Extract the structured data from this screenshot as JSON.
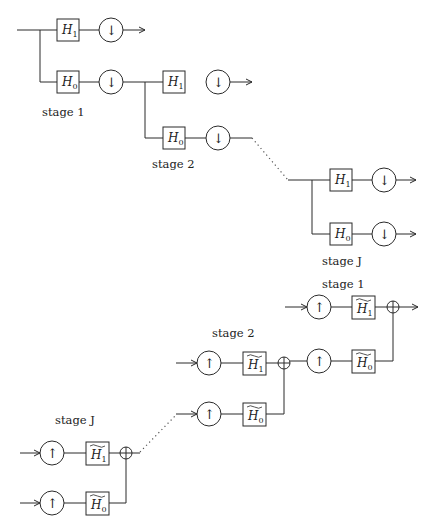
{
  "diagram": {
    "analysis": {
      "stages": [
        {
          "label": "stage 1",
          "highpass": {
            "name": "H",
            "sub": "1"
          },
          "lowpass": {
            "name": "H",
            "sub": "0"
          },
          "downsample_symbol": "↓"
        },
        {
          "label": "stage 2",
          "highpass": {
            "name": "H",
            "sub": "1"
          },
          "lowpass": {
            "name": "H",
            "sub": "0"
          },
          "downsample_symbol": "↓"
        },
        {
          "label": "stage J",
          "highpass": {
            "name": "H",
            "sub": "1"
          },
          "lowpass": {
            "name": "H",
            "sub": "0"
          },
          "downsample_symbol": "↓"
        }
      ]
    },
    "synthesis": {
      "stages": [
        {
          "label": "stage 1",
          "highpass": {
            "name": "H",
            "sub": "1",
            "tilde": true
          },
          "lowpass": {
            "name": "H",
            "sub": "0",
            "tilde": true
          },
          "upsample_symbol": "↑",
          "sum_symbol": "⊕"
        },
        {
          "label": "stage 2",
          "highpass": {
            "name": "H",
            "sub": "1",
            "tilde": true
          },
          "lowpass": {
            "name": "H",
            "sub": "0",
            "tilde": true
          },
          "upsample_symbol": "↑",
          "sum_symbol": "⊕"
        },
        {
          "label": "stage J",
          "highpass": {
            "name": "H",
            "sub": "1",
            "tilde": true
          },
          "lowpass": {
            "name": "H",
            "sub": "0",
            "tilde": true
          },
          "upsample_symbol": "↑",
          "sum_symbol": "⊕"
        }
      ]
    },
    "colors": {
      "stroke": "#2a2a2a",
      "text": "#222222",
      "background": "#ffffff"
    }
  }
}
